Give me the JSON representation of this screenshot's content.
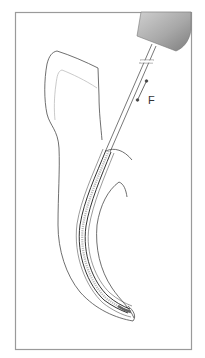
{
  "figure": {
    "labels": {
      "force": "F"
    },
    "colors": {
      "frame": "#9a9a9a",
      "outline": "#4a4a4a",
      "inner_outline": "#bdbdbd",
      "handpiece_light": "#c8c8c8",
      "handpiece_dark": "#8a8a8a",
      "file": "#3a3a3a"
    },
    "parts": [
      "frame",
      "handpiece-head",
      "file-shaft",
      "force-arrow",
      "tooth-outline",
      "pulp-crown-line",
      "root-canal-walls",
      "file-in-canal"
    ]
  }
}
